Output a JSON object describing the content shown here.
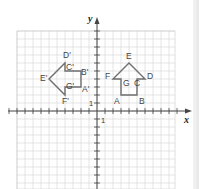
{
  "diagram": {
    "type": "coordinate-grid-rotation",
    "axes": {
      "x_label": "x",
      "y_label": "y",
      "x_unit_label": "1",
      "y_unit_label": "1",
      "x_range": [
        -10,
        9
      ],
      "y_range": [
        -10,
        10
      ]
    },
    "colors": {
      "grid": "#d4d4d4",
      "axis": "#444444",
      "shape_stroke": "#6e6e6e",
      "label": "#444444"
    },
    "original_shape": {
      "name": "ABCDEFG",
      "vertices": [
        {
          "label": "A",
          "x": 3,
          "y": 2
        },
        {
          "label": "B",
          "x": 5,
          "y": 2
        },
        {
          "label": "C",
          "x": 5,
          "y": 4
        },
        {
          "label": "D",
          "x": 6,
          "y": 4
        },
        {
          "label": "E",
          "x": 4,
          "y": 6
        },
        {
          "label": "F",
          "x": 2,
          "y": 4
        },
        {
          "label": "G",
          "x": 3,
          "y": 4
        }
      ]
    },
    "image_shape": {
      "name": "A'B'C'D'E'F'G'",
      "vertices": [
        {
          "label": "A'",
          "x": -2,
          "y": 3
        },
        {
          "label": "B'",
          "x": -2,
          "y": 5
        },
        {
          "label": "C'",
          "x": -4,
          "y": 5
        },
        {
          "label": "D'",
          "x": -4,
          "y": 6
        },
        {
          "label": "E'",
          "x": -6,
          "y": 4
        },
        {
          "label": "F'",
          "x": -4,
          "y": 2
        },
        {
          "label": "G'",
          "x": -4,
          "y": 3
        }
      ]
    },
    "transformation": "90° counterclockwise rotation about the origin"
  }
}
